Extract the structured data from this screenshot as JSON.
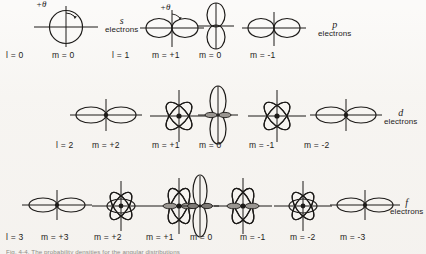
{
  "figure": {
    "background": "#f7f5f2",
    "ink": "#1d1b19",
    "rows": [
      {
        "id": "s-p-row",
        "shell_label": {
          "symbol": "s",
          "word": "electrons"
        },
        "shell_label_2": {
          "symbol": "p",
          "word": "electrons"
        },
        "theta_label": "+θ",
        "theta_label_2": "+θ",
        "items": [
          {
            "l": "l = 0",
            "m": "m = 0",
            "shape": "sphere"
          },
          {
            "l": "l = 1",
            "m": "m = +1",
            "shape": "p-horizontal"
          },
          {
            "l": "",
            "m": "m = 0",
            "shape": "p-vertical"
          },
          {
            "l": "",
            "m": "m = -1",
            "shape": "p-horizontal"
          }
        ]
      },
      {
        "id": "d-row",
        "shell_label": {
          "symbol": "d",
          "word": "electrons"
        },
        "items": [
          {
            "l": "l = 2",
            "m": "m = +2",
            "shape": "d-horizontal"
          },
          {
            "l": "",
            "m": "m = +1",
            "shape": "d-clover"
          },
          {
            "l": "",
            "m": "m = 0",
            "shape": "d-vertical"
          },
          {
            "l": "",
            "m": "m = -1",
            "shape": "d-clover"
          },
          {
            "l": "",
            "m": "m = -2",
            "shape": "d-horizontal"
          }
        ]
      },
      {
        "id": "f-row",
        "shell_label": {
          "symbol": "f",
          "word": "electrons"
        },
        "items": [
          {
            "l": "l = 3",
            "m": "m = +3",
            "shape": "f-horizontal"
          },
          {
            "l": "",
            "m": "m = +2",
            "shape": "f-clover"
          },
          {
            "l": "",
            "m": "m = +1",
            "shape": "f-clover-side"
          },
          {
            "l": "",
            "m": "m = 0",
            "shape": "f-vertical"
          },
          {
            "l": "",
            "m": "m = -1",
            "shape": "f-clover-side"
          },
          {
            "l": "",
            "m": "m = -2",
            "shape": "f-clover"
          },
          {
            "l": "",
            "m": "m = -3",
            "shape": "f-horizontal"
          }
        ]
      }
    ],
    "caption": "Fig. 4-4.  The probability densities for the angular distributions"
  }
}
